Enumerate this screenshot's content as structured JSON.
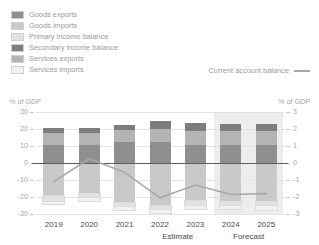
{
  "legend": {
    "items": [
      {
        "label": "Goods exports",
        "color": "#8f8f8f"
      },
      {
        "label": "Goods imports",
        "color": "#c9c9c9"
      },
      {
        "label": "Primary income balance",
        "color": "#e2e2e2"
      },
      {
        "label": "Secondary income balance",
        "color": "#7d7d7d"
      },
      {
        "label": "Services exports",
        "color": "#b4b4b4"
      },
      {
        "label": "Services imports",
        "color": "#f2f2f2"
      }
    ],
    "line_series_label": "Current account balance",
    "line_color": "#a8a8a8"
  },
  "axes": {
    "left_caption": "% of GDP",
    "right_caption": "% of GDP",
    "left_ticks": [
      "30",
      "20",
      "10",
      "0",
      "-10",
      "-20",
      "-30"
    ],
    "right_ticks": [
      "3",
      "2",
      "1",
      "0",
      "-1",
      "-2",
      "-3"
    ]
  },
  "annotations": {
    "estimate": "Estimate",
    "forecast": "Forecast"
  },
  "chart_data": {
    "type": "bar",
    "title": "",
    "subtitle": "",
    "xlabel": "",
    "ylabel": "% of GDP",
    "y2label": "% of GDP",
    "ylim": [
      -30,
      30
    ],
    "y2lim": [
      -3,
      3
    ],
    "grid": true,
    "legend_position": "top-left",
    "categories": [
      "2019",
      "2020",
      "2021",
      "2022",
      "2023",
      "2024",
      "2025"
    ],
    "series": [
      {
        "name": "Goods exports",
        "color": "#8f8f8f",
        "values": [
          10.5,
          10.3,
          12.2,
          12.6,
          10.8,
          10.6,
          10.7
        ]
      },
      {
        "name": "Services exports",
        "color": "#b4b4b4",
        "values": [
          7.2,
          7.3,
          7.0,
          7.6,
          8.2,
          8.4,
          8.3
        ]
      },
      {
        "name": "Secondary income balance",
        "color": "#7d7d7d",
        "values": [
          3.0,
          3.1,
          3.4,
          4.3,
          4.3,
          4.2,
          4.1
        ]
      },
      {
        "name": "Goods imports",
        "color": "#c9c9c9",
        "values": [
          -19.5,
          -18.0,
          -23.6,
          -25.2,
          -22.6,
          -23.0,
          -23.1
        ]
      },
      {
        "name": "Primary income balance",
        "color": "#e2e2e2",
        "values": [
          -3.4,
          -2.7,
          -2.4,
          -2.7,
          -2.6,
          -2.2,
          -2.1
        ]
      },
      {
        "name": "Services imports",
        "color": "#f2f2f2",
        "values": [
          -1.5,
          -1.4,
          -1.6,
          -1.8,
          -1.8,
          -2.1,
          -2.2
        ]
      }
    ],
    "line_series": {
      "name": "Current account balance",
      "color": "#a8a8a8",
      "axis": "right",
      "values": [
        -1.1,
        0.25,
        -0.55,
        -2.05,
        -1.3,
        -1.85,
        -1.8
      ]
    },
    "shaded_regions": [
      {
        "label": "Forecast",
        "from": "2024",
        "to": "2025",
        "color": "#ededed"
      }
    ]
  }
}
